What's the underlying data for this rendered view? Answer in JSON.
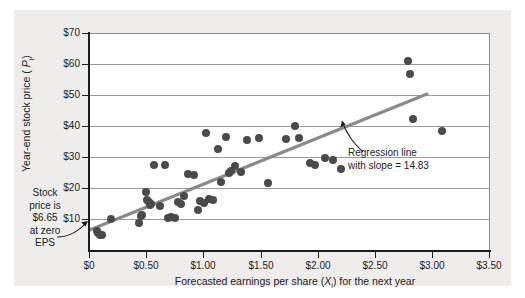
{
  "chart_data": {
    "type": "scatter",
    "title": "",
    "xlabel": "Forecasted earnings per share (Xᵢ) for the next year",
    "ylabel": "Year-end stock price ( Pᵢ)",
    "xlim": [
      0,
      3.5
    ],
    "ylim": [
      0,
      70
    ],
    "grid": true,
    "legend_position": "none",
    "xticks": [
      "$0",
      "$0.50",
      "$1.00",
      "$1.50",
      "$2.00",
      "$2.50",
      "$3.00",
      "$3.50"
    ],
    "xtick_values": [
      0,
      0.5,
      1.0,
      1.5,
      2.0,
      2.5,
      3.0,
      3.5
    ],
    "yticks": [
      "$10",
      "$20",
      "$30",
      "$40",
      "$50",
      "$60",
      "$70"
    ],
    "ytick_values": [
      10,
      20,
      30,
      40,
      50,
      60,
      70
    ],
    "series": [
      {
        "name": "Firms",
        "marker": "circle",
        "color": "#4a4a4a",
        "points": [
          [
            0.07,
            6.5
          ],
          [
            0.08,
            5.8
          ],
          [
            0.1,
            5.2
          ],
          [
            0.11,
            5.0
          ],
          [
            0.19,
            10.2
          ],
          [
            0.44,
            8.9
          ],
          [
            0.45,
            11.3
          ],
          [
            0.46,
            11.6
          ],
          [
            0.5,
            19.0
          ],
          [
            0.51,
            16.5
          ],
          [
            0.52,
            15.6
          ],
          [
            0.53,
            14.8
          ],
          [
            0.54,
            15.2
          ],
          [
            0.57,
            27.5
          ],
          [
            0.62,
            14.5
          ],
          [
            0.66,
            27.6
          ],
          [
            0.69,
            10.5
          ],
          [
            0.72,
            10.8
          ],
          [
            0.75,
            10.6
          ],
          [
            0.78,
            15.8
          ],
          [
            0.8,
            15.0
          ],
          [
            0.83,
            17.8
          ],
          [
            0.86,
            24.7
          ],
          [
            0.92,
            24.4
          ],
          [
            0.95,
            13.3
          ],
          [
            0.97,
            16.2
          ],
          [
            1.0,
            15.4
          ],
          [
            1.02,
            38.0
          ],
          [
            1.05,
            16.8
          ],
          [
            1.08,
            16.4
          ],
          [
            1.13,
            32.8
          ],
          [
            1.15,
            22.0
          ],
          [
            1.2,
            36.5
          ],
          [
            1.22,
            25.0
          ],
          [
            1.24,
            25.8
          ],
          [
            1.27,
            27.3
          ],
          [
            1.33,
            25.5
          ],
          [
            1.38,
            35.8
          ],
          [
            1.48,
            36.2
          ],
          [
            1.56,
            21.8
          ],
          [
            1.72,
            36.0
          ],
          [
            1.8,
            40.2
          ],
          [
            1.83,
            36.4
          ],
          [
            1.93,
            28.3
          ],
          [
            1.97,
            27.7
          ],
          [
            2.06,
            30.0
          ],
          [
            2.13,
            29.3
          ],
          [
            2.2,
            26.4
          ],
          [
            2.78,
            61.0
          ],
          [
            2.8,
            56.8
          ],
          [
            2.83,
            42.5
          ],
          [
            3.08,
            38.5
          ]
        ]
      }
    ],
    "regression": {
      "slope": 14.83,
      "intercept": 6.65,
      "color": "#8a8a8a",
      "x_start": 0.0,
      "x_end": 2.95
    },
    "annotations": [
      {
        "name": "regression-line-note",
        "lines": [
          "Regression line",
          "with slope = 14.83"
        ]
      },
      {
        "name": "intercept-note",
        "lines": [
          "Stock",
          "price is",
          "$6.65",
          "at zero",
          "EPS"
        ]
      }
    ]
  },
  "axis": {
    "y_title_pre": "Year-end stock price ( ",
    "y_title_var": "P",
    "y_title_sub": "i",
    "y_title_post": ")",
    "x_title_pre": "Forecasted earnings per share (",
    "x_title_var": "X",
    "x_title_sub": "i",
    "x_title_post": ") for the next year"
  },
  "annotations": {
    "regression_line_1": "Regression line",
    "regression_line_2": "with slope = 14.83",
    "stock_1": "Stock",
    "stock_2": "price is",
    "stock_3": "$6.65",
    "stock_4": "at zero",
    "stock_5": "EPS"
  },
  "colors": {
    "card_background": "#eeedeb",
    "plot_background": "#ffffff",
    "axis": "#1c1c1c",
    "grid": "#9a9a9a",
    "marker": "#4a4a4a",
    "regression": "#8a8a8a"
  }
}
